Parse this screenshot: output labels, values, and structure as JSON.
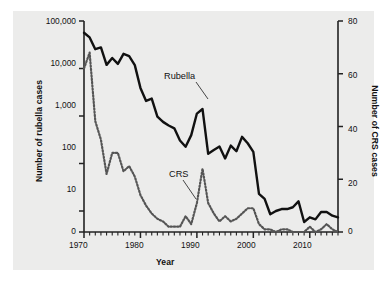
{
  "chart_data": {
    "type": "line",
    "title": "",
    "subtitle": "",
    "xlabel": "Year",
    "ylabel": "Number of rubella cases",
    "y2label": "Number of CRS cases",
    "grid": false,
    "legend_position": "inline-annotation",
    "xlim": [
      1970,
      2015
    ],
    "xticks": [
      1970,
      1980,
      1990,
      2000,
      2010
    ],
    "xtick_labels": [
      "1970",
      "1980",
      "1990",
      "2000",
      "2010"
    ],
    "x_minor_tick_step": 1,
    "yscale": "log-with-zero",
    "ylim": [
      0,
      100000
    ],
    "yticks": [
      0,
      10,
      100,
      1000,
      10000,
      100000
    ],
    "ytick_labels": [
      "0",
      "10",
      "100",
      "1,000",
      "10,000",
      "100,000"
    ],
    "y2lim": [
      0,
      80
    ],
    "y2ticks": [
      0,
      20,
      40,
      60,
      80
    ],
    "y2tick_labels": [
      "0",
      "20",
      "40",
      "60",
      "80"
    ],
    "annotations": [
      {
        "text": "Rubella",
        "series": "Rubella",
        "x": 1988,
        "y_px": 78
      },
      {
        "text": "CRS",
        "series": "CRS",
        "x": 1985,
        "y_px": 176
      }
    ],
    "series": [
      {
        "name": "Rubella",
        "axis": "left",
        "style": "solid",
        "color": "#111111",
        "linewidth": 2.4,
        "x": [
          1970,
          1971,
          1972,
          1973,
          1974,
          1975,
          1976,
          1977,
          1978,
          1979,
          1980,
          1981,
          1982,
          1983,
          1984,
          1985,
          1986,
          1987,
          1988,
          1989,
          1990,
          1991,
          1992,
          1993,
          1994,
          1995,
          1996,
          1997,
          1998,
          1999,
          2000,
          2001,
          2002,
          2003,
          2004,
          2005,
          2006,
          2007,
          2008,
          2009,
          2010,
          2011,
          2012,
          2013,
          2014,
          2015
        ],
        "values": [
          56552,
          45086,
          25507,
          27804,
          11917,
          16652,
          12491,
          20395,
          18269,
          11795,
          3904,
          2077,
          2325,
          970,
          752,
          630,
          551,
          306,
          225,
          396,
          1125,
          1401,
          160,
          192,
          227,
          128,
          238,
          181,
          364,
          267,
          176,
          23,
          18,
          7,
          10,
          11,
          11,
          12,
          16,
          3,
          5,
          4,
          9,
          9,
          6,
          5
        ]
      },
      {
        "name": "CRS",
        "axis": "right",
        "style": "dotted",
        "color": "#555555",
        "linewidth": 2.2,
        "x": [
          1970,
          1971,
          1972,
          1973,
          1974,
          1975,
          1976,
          1977,
          1978,
          1979,
          1980,
          1981,
          1982,
          1983,
          1984,
          1985,
          1986,
          1987,
          1988,
          1989,
          1990,
          1991,
          1992,
          1993,
          1994,
          1995,
          1996,
          1997,
          1998,
          1999,
          2000,
          2001,
          2002,
          2003,
          2004,
          2005,
          2006,
          2007,
          2008,
          2009,
          2010,
          2011,
          2012,
          2013,
          2014,
          2015
        ],
        "values": [
          62,
          68,
          42,
          35,
          22,
          30,
          30,
          23,
          25,
          21,
          14,
          10,
          7,
          5,
          4,
          2,
          2,
          2,
          6,
          3,
          11,
          24,
          11,
          7,
          4,
          6,
          4,
          5,
          7,
          9,
          9,
          3,
          1,
          1,
          0,
          1,
          1,
          0,
          0,
          0,
          2,
          0,
          1,
          3,
          1,
          0
        ]
      }
    ]
  },
  "axes": {
    "left_title": "Number of rubella cases",
    "right_title": "Number of CRS cases",
    "x_title": "Year"
  },
  "labels": {
    "rubella": "Rubella",
    "crs": "CRS"
  },
  "ytick_left": {
    "t0": "0",
    "t1": "10",
    "t2": "100",
    "t3": "1,000",
    "t4": "10,000",
    "t5": "100,000"
  },
  "ytick_right": {
    "t0": "0",
    "t1": "20",
    "t2": "40",
    "t3": "60",
    "t4": "80"
  },
  "xtick": {
    "t0": "1970",
    "t1": "1980",
    "t2": "1990",
    "t3": "2000",
    "t4": "2010"
  },
  "colors": {
    "panel_bg": "#ececeb",
    "figure_bg": "#ffffff",
    "rubella_line": "#111111",
    "crs_line": "#555555",
    "axis": "#222222"
  }
}
